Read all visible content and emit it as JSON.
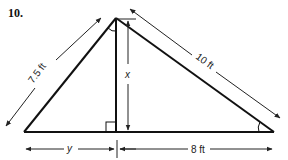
{
  "problem": {
    "number": "10."
  },
  "figure": {
    "type": "right-triangle-with-altitude",
    "labels": {
      "left_side": "7.5 ft",
      "right_side": "10 ft",
      "altitude": "x",
      "left_base_segment": "y",
      "right_base_segment": "8 ft"
    },
    "markers": {
      "right_angle_at_altitude_foot": true,
      "angle_arc_at_apex_left": true,
      "angle_arc_at_right_base": true
    },
    "colors": {
      "stroke": "#111111",
      "dimension": "#333333",
      "background": "#ffffff"
    }
  }
}
